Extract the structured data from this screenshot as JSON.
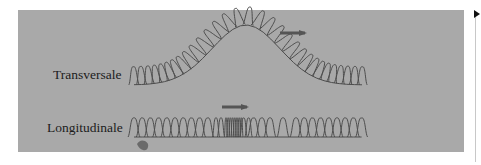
{
  "figure": {
    "panel_color": "#a9a9a9",
    "spring_color": "#4d4d4d",
    "arrow_color": "#555555",
    "labels": {
      "transverse": "Transversale",
      "longitudinal": "Longitudinale"
    },
    "transverse_wave": {
      "x_start": 130,
      "x_end": 366,
      "baseline_y": 85,
      "loop_height": 18,
      "loop_spacing": 7.6,
      "pulse_center_x": 246,
      "pulse_amplitude": 60,
      "pulse_width": 48,
      "arrow": {
        "x1": 280,
        "x2": 311,
        "y": 33
      }
    },
    "longitudinal_wave": {
      "x_start": 130,
      "x_end": 366,
      "baseline_y": 137,
      "loop_height": 19,
      "loop_spacing": 8.2,
      "compression_center_x": 233,
      "compression_width": 10,
      "rarefaction_center_x": 278,
      "rarefaction_width": 14,
      "arrow": {
        "x1": 222,
        "x2": 253,
        "y": 107
      }
    },
    "hand_marker": {
      "x": 142,
      "y": 146
    }
  },
  "side_marker": {
    "icon": "triangle-right-icon"
  }
}
